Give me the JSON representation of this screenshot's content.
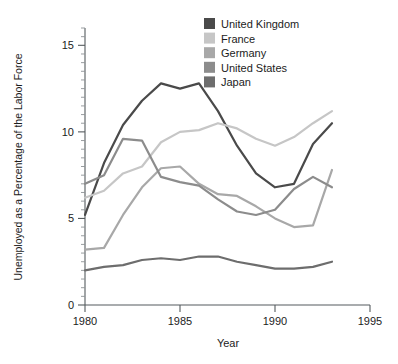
{
  "chart_data": {
    "type": "line",
    "title": "",
    "xlabel": "Year",
    "ylabel": "Unemployed as a Percentage of the Labor Force",
    "xlim": [
      1980,
      1995
    ],
    "ylim": [
      0,
      16
    ],
    "xticks": [
      1980,
      1985,
      1990,
      1995
    ],
    "xtick_labels": [
      "1980",
      "1985",
      "1990",
      "1995"
    ],
    "yticks": [
      0,
      5,
      10,
      15
    ],
    "ytick_labels": [
      "0",
      "5",
      "10",
      "15"
    ],
    "y_minor_step": 0.5,
    "grid": false,
    "legend_position": "top-center",
    "x": [
      1980,
      1981,
      1982,
      1983,
      1984,
      1985,
      1986,
      1987,
      1988,
      1989,
      1990,
      1991,
      1992,
      1993
    ],
    "series": [
      {
        "name": "United Kingdom",
        "color": "#4a4a4a",
        "values": [
          5.2,
          8.2,
          10.4,
          11.8,
          12.8,
          12.5,
          12.8,
          11.2,
          9.2,
          7.6,
          6.8,
          7.0,
          9.3,
          10.5
        ]
      },
      {
        "name": "France",
        "color": "#c6c6c6",
        "values": [
          6.2,
          6.6,
          7.6,
          8.0,
          9.4,
          10.0,
          10.1,
          10.5,
          10.2,
          9.6,
          9.2,
          9.7,
          10.5,
          11.2
        ]
      },
      {
        "name": "Germany",
        "color": "#a8a8a8",
        "values": [
          3.2,
          3.3,
          5.2,
          6.8,
          7.9,
          8.0,
          7.0,
          6.4,
          6.3,
          5.7,
          5.0,
          4.5,
          4.6,
          7.8
        ]
      },
      {
        "name": "United States",
        "color": "#8c8c8c",
        "values": [
          7.0,
          7.5,
          9.6,
          9.5,
          7.4,
          7.1,
          6.9,
          6.1,
          5.4,
          5.2,
          5.5,
          6.7,
          7.4,
          6.8
        ]
      },
      {
        "name": "Japan",
        "color": "#6d6d6d",
        "values": [
          2.0,
          2.2,
          2.3,
          2.6,
          2.7,
          2.6,
          2.8,
          2.8,
          2.5,
          2.3,
          2.1,
          2.1,
          2.2,
          2.5
        ]
      }
    ]
  },
  "legend": {
    "items": [
      {
        "label": "United Kingdom",
        "color": "#4a4a4a"
      },
      {
        "label": "France",
        "color": "#c6c6c6"
      },
      {
        "label": "Germany",
        "color": "#a8a8a8"
      },
      {
        "label": "United States",
        "color": "#8c8c8c"
      },
      {
        "label": "Japan",
        "color": "#6d6d6d"
      }
    ]
  },
  "axis": {
    "x_title": "Year",
    "y_title": "Unemployed as a Percentage of the Labor Force"
  }
}
